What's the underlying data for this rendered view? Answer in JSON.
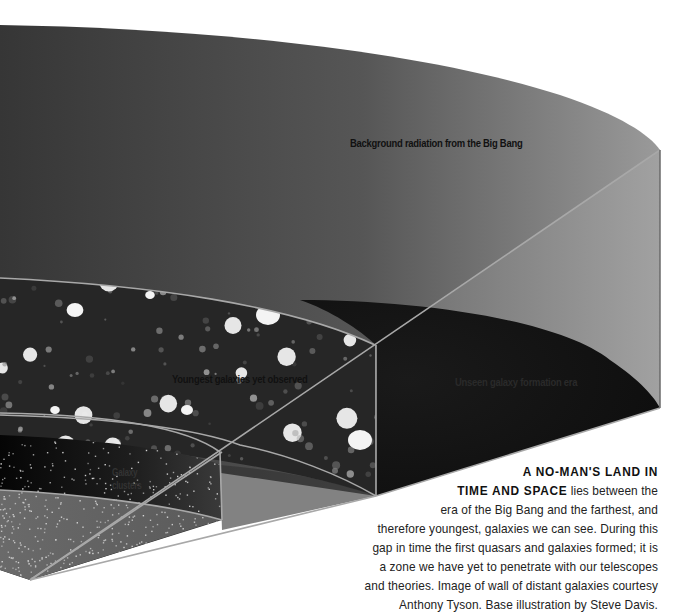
{
  "diagram": {
    "labels": {
      "background_radiation": "Background radiation from the Big Bang",
      "youngest_galaxies": "Youngest galaxies yet observed",
      "unseen_era": "Unseen galaxy formation era",
      "galaxy_clusters": "Galaxy clusters"
    },
    "colors": {
      "outer_shell_dark": "#3a3a3a",
      "outer_shell_light": "#8c8c8c",
      "unseen_era": "#151515",
      "galaxy_field": "#2a2a2a",
      "edge_lines": "#a8a8a8",
      "background": "#ffffff"
    }
  },
  "caption": {
    "lead_line1": "A NO-MAN'S LAND IN",
    "lead_line2": "TIME AND SPACE",
    "line2_rest": " lies between the",
    "lines": [
      "era of the Big Bang and the farthest, and",
      "therefore youngest, galaxies we can see. During this",
      "gap in time the first quasars and galaxies formed; it is",
      "a zone we have yet to penetrate with our telescopes",
      "and theories. Image of wall of distant galaxies courtesy",
      "Anthony Tyson. Base illustration by Steve Davis."
    ]
  }
}
